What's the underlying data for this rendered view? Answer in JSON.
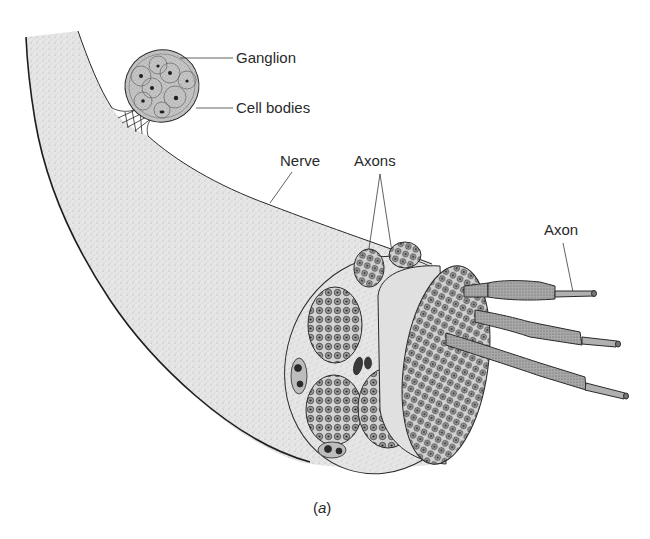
{
  "figure": {
    "caption": "(a)",
    "caption_letter": "a"
  },
  "labels": {
    "ganglion": "Ganglion",
    "cell_bodies": "Cell bodies",
    "nerve": "Nerve",
    "axons": "Axons",
    "axon": "Axon"
  },
  "colors": {
    "background": "#ffffff",
    "nerve_fill": "#e4e4e4",
    "outline": "#2a2a2a",
    "fascicle_fill": "#cfcfcf",
    "axon_fill": "#9a9a9a",
    "nucleus": "#1e1e1e"
  }
}
